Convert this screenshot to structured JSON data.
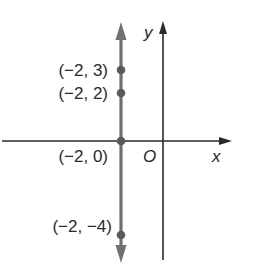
{
  "diagram": {
    "type": "coordinate-plane",
    "axes": {
      "x_label": "x",
      "y_label": "y",
      "origin_label": "O"
    },
    "line": {
      "equation": "x = -2",
      "color": "#707070"
    },
    "points": [
      {
        "x": -2,
        "y": 3,
        "label": "(−2, 3)"
      },
      {
        "x": -2,
        "y": 2,
        "label": "(−2, 2)"
      },
      {
        "x": -2,
        "y": 0,
        "label": "(−2, 0)"
      },
      {
        "x": -2,
        "y": -4,
        "label": "(−2, −4)"
      }
    ],
    "colors": {
      "axis": "#2a2a2a",
      "line": "#707070",
      "point": "#5a5a5a",
      "background": "#ffffff"
    }
  }
}
